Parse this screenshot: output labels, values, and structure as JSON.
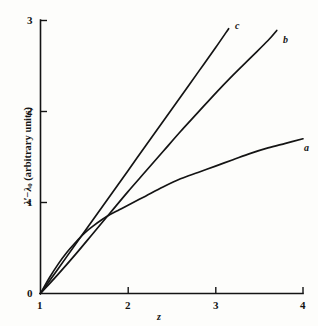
{
  "figure": {
    "background_color": "#fdfdfb",
    "ink_color": "#141414"
  },
  "chart_data": {
    "type": "line",
    "title": "",
    "subtitle": "",
    "xlabel": "z",
    "ylabel": "λ′ − λ₀ (arbitrary units)",
    "xlim": [
      1,
      4
    ],
    "ylim": [
      0,
      3
    ],
    "xticks": [
      1,
      2,
      3,
      4
    ],
    "yticks": [
      0,
      1,
      2,
      3
    ],
    "xticklabels": [
      "1",
      "2",
      "3",
      "4"
    ],
    "yticklabels": [
      "0",
      "1",
      "2",
      "3"
    ],
    "grid": false,
    "legend": "inline-curve-labels",
    "series": [
      {
        "name": "a",
        "label": "a",
        "label_position": [
          4.08,
          1.6
        ],
        "end_point": [
          4.0,
          1.7
        ],
        "shape": "concave-increasing",
        "x": [
          1.0,
          1.1,
          1.2,
          1.3,
          1.4,
          1.5,
          1.6,
          1.7,
          1.8,
          1.9,
          2.0,
          2.2,
          2.4,
          2.6,
          2.8,
          3.0,
          3.2,
          3.4,
          3.6,
          3.8,
          4.0
        ],
        "y": [
          0.0,
          0.17,
          0.32,
          0.45,
          0.56,
          0.66,
          0.74,
          0.81,
          0.87,
          0.92,
          0.97,
          1.07,
          1.17,
          1.26,
          1.33,
          1.4,
          1.47,
          1.54,
          1.6,
          1.65,
          1.7
        ]
      },
      {
        "name": "b",
        "label": "b",
        "label_position": [
          3.78,
          2.82
        ],
        "end_point": [
          3.7,
          2.89
        ],
        "shape": "near-linear-slightly-concave",
        "x": [
          1.0,
          1.2,
          1.4,
          1.6,
          1.8,
          2.0,
          2.2,
          2.4,
          2.6,
          2.8,
          3.0,
          3.2,
          3.4,
          3.6,
          3.7
        ],
        "y": [
          0.0,
          0.21,
          0.43,
          0.66,
          0.89,
          1.12,
          1.34,
          1.56,
          1.78,
          1.99,
          2.2,
          2.4,
          2.59,
          2.78,
          2.89
        ]
      },
      {
        "name": "c",
        "label": "c",
        "label_position": [
          3.22,
          2.88
        ],
        "end_point": [
          3.15,
          2.91
        ],
        "shape": "linear",
        "x": [
          1.0,
          1.2,
          1.4,
          1.6,
          1.8,
          2.0,
          2.2,
          2.4,
          2.6,
          2.8,
          3.0,
          3.15
        ],
        "y": [
          0.0,
          0.27,
          0.54,
          0.81,
          1.08,
          1.35,
          1.62,
          1.89,
          2.16,
          2.43,
          2.7,
          2.91
        ]
      }
    ]
  },
  "axes": {
    "x_title": "z",
    "y_title_full": "λ′ − λ₀ (arbitrary units)",
    "y_title_parts": {
      "lambda_prime": "λ′",
      "minus": "−",
      "lambda": "λ",
      "subscript": "0",
      "units": "(arbitrary units)"
    }
  },
  "labels": {
    "x_ticks": [
      "1",
      "2",
      "3",
      "4"
    ],
    "y_ticks": [
      "0",
      "1",
      "2",
      "3"
    ],
    "curves": [
      "a",
      "b",
      "c"
    ]
  }
}
